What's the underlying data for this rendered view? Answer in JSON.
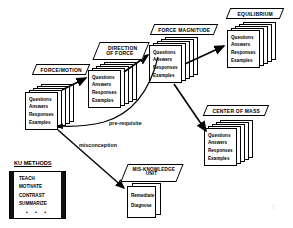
{
  "diagram": {
    "card_fields": [
      "Questions",
      "Answers",
      "Responses",
      "Examples"
    ],
    "colors": {
      "stroke": "#000000",
      "background": "#ffffff",
      "legend_bar": "#111111"
    },
    "nodes": [
      {
        "id": "force-motion",
        "label": "FORCE/MOTION",
        "label_lines": [
          "FORCE/MOTION"
        ],
        "fields": [
          "Questions",
          "Answers",
          "Responses",
          "Examples"
        ],
        "stack_count": 5
      },
      {
        "id": "direction-of-force",
        "label": "DIRECTION OF FORCE",
        "label_lines": [
          "DIRECTION",
          "OF FORCE"
        ],
        "fields": [
          "Questions",
          "Answers",
          "Responses",
          "Examples"
        ],
        "stack_count": 5
      },
      {
        "id": "force-magnitude",
        "label": "FORCE MAGNITUDE",
        "label_lines": [
          "FORCE MAGNITUDE"
        ],
        "fields": [
          "Questions",
          "Answers",
          "Responses",
          "Examples"
        ],
        "stack_count": 5
      },
      {
        "id": "equilibrium",
        "label": "EQUILIBRIUM",
        "label_lines": [
          "EQUILIBRIUM"
        ],
        "fields": [
          "Questions",
          "Answers",
          "Responses",
          "Examples"
        ],
        "stack_count": 5
      },
      {
        "id": "center-of-mass",
        "label": "CENTER OF MASS",
        "label_lines": [
          "CENTER OF MASS"
        ],
        "fields": [
          "Questions",
          "Answers",
          "Responses",
          "Examples"
        ],
        "stack_count": 5
      },
      {
        "id": "mis-knowledge-unit",
        "label": "MIS-KNOWLEDGE UNIT",
        "label_lines": [
          "MIS-KNOWLEDGE",
          "UNIT"
        ],
        "fields": [
          "Remediate",
          "Diagnose"
        ],
        "stack_count": 2
      }
    ],
    "edges": [
      {
        "id": "fm-to-dof",
        "from": "force-motion",
        "to": "direction-of-force",
        "label": ""
      },
      {
        "id": "dof-to-fmag",
        "from": "direction-of-force",
        "to": "force-magnitude",
        "label": ""
      },
      {
        "id": "fmag-to-eq",
        "from": "force-magnitude",
        "to": "equilibrium",
        "label": ""
      },
      {
        "id": "fmag-to-com",
        "from": "force-magnitude",
        "to": "center-of-mass",
        "label": ""
      },
      {
        "id": "prerequisite",
        "from": "force-magnitude",
        "to": "force-motion",
        "label": "pre-requisite"
      },
      {
        "id": "misconception",
        "from": "force-motion",
        "to": "mis-knowledge-unit",
        "label": "misconception"
      }
    ],
    "legend": {
      "title": "KU METHODS",
      "items": [
        "TEACH",
        "MOTIVATE",
        "CONTRAST",
        "SUMMARIZE"
      ],
      "ellipsis": "• • •"
    }
  }
}
